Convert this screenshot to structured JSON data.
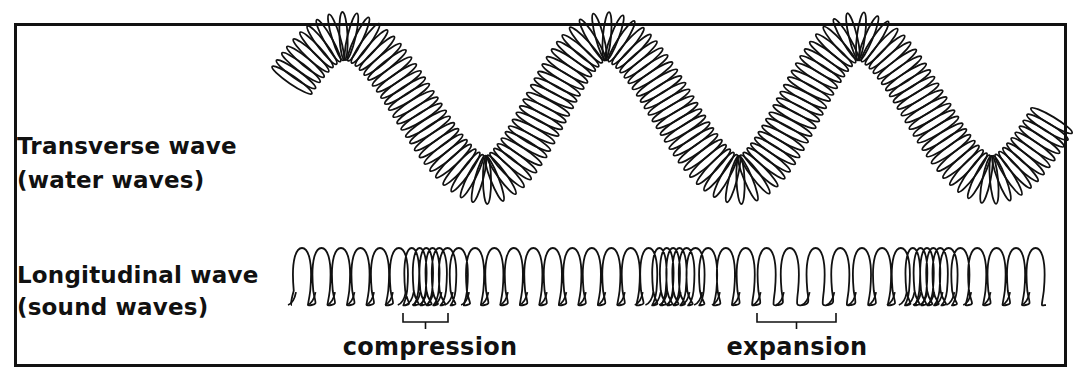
{
  "diagram": {
    "colors": {
      "ink": "#111111",
      "background": "#ffffff"
    },
    "transverse": {
      "label_line1": "Transverse wave",
      "label_line2": "(water waves)",
      "spring": {
        "x_start": 292,
        "x_end": 1052,
        "center_y": 108,
        "amplitude": 72,
        "crest_x": [
          345,
          605,
          858
        ],
        "trough_x": [
          487,
          740,
          992
        ],
        "coil_count": 150,
        "coil_rx": 9,
        "coil_ry": 24
      }
    },
    "longitudinal": {
      "label_line1": "Longitudinal wave",
      "label_line2": "(sound waves)",
      "spring": {
        "x_start": 292,
        "x_end": 1048,
        "top_y": 248,
        "base_y": 305,
        "compression_centers": [
          425,
          670,
          925
        ],
        "expansion_center": 797
      },
      "annotations": [
        {
          "label": "compression",
          "bracket_x1": 403,
          "bracket_x2": 448,
          "label_x": 430
        },
        {
          "label": "expansion",
          "bracket_x1": 757,
          "bracket_x2": 836,
          "label_x": 797
        }
      ]
    }
  }
}
